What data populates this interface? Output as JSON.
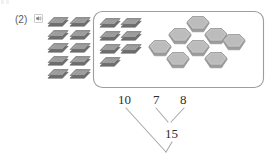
{
  "exercise": {
    "number_label": "(2)",
    "audio_icon": "speaker-icon"
  },
  "palette": {
    "slab_top": "#9a9a9a",
    "slab_top_light": "#b4b4b4",
    "slab_side": "#6f6f6f",
    "slab_outline": "#5d5d5d",
    "hex_fill": "#b9b9b9",
    "hex_outline": "#8e8e8e",
    "hex_side": "#9c9c9c",
    "box_stroke": "#9d9d9d",
    "ink": "#2e2e2e",
    "label_gray": "#5a5a5a",
    "line_gray": "#a9a9a9",
    "page_bg": "#ffffff"
  },
  "manipulatives": {
    "outside_group": {
      "name": "ten-slabs-outside-box",
      "shape": "parallelogram-slab",
      "count": 10,
      "rows": [
        2,
        2,
        2,
        2,
        2
      ]
    },
    "inside_slabs": {
      "name": "seven-slabs-inside-box",
      "shape": "parallelogram-slab",
      "count": 7,
      "rows": [
        2,
        2,
        2,
        1
      ]
    },
    "inside_hexagons": {
      "name": "eight-hexagons-inside-box",
      "shape": "hexagon-prism",
      "count": 8,
      "rows": [
        1,
        3,
        3,
        1
      ]
    }
  },
  "number_bond": {
    "top_numbers": [
      "10",
      "7",
      "8"
    ],
    "sum_label": "15",
    "ten_value": "10",
    "addend_a": "7",
    "addend_b": "8",
    "partial_sum": "15"
  }
}
